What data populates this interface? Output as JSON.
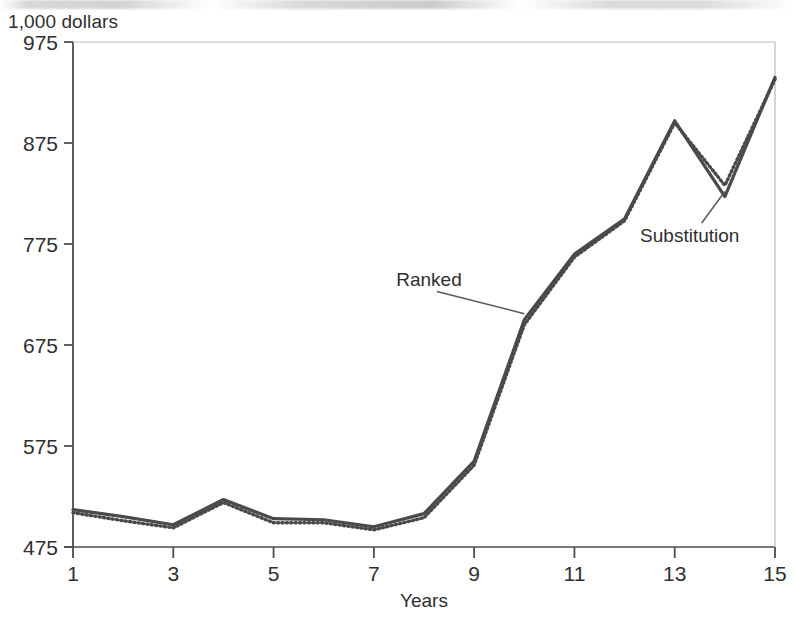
{
  "chart_data": {
    "type": "line",
    "title": "1,000 dollars",
    "subtitle": "",
    "xlabel": "Years",
    "ylabel": "1,000 dollars",
    "x": [
      1,
      2,
      3,
      4,
      5,
      6,
      7,
      8,
      9,
      10,
      11,
      12,
      13,
      14,
      15
    ],
    "xlim": [
      1,
      15
    ],
    "ylim": [
      475,
      975
    ],
    "xticks": [
      1,
      3,
      5,
      7,
      9,
      11,
      13,
      15
    ],
    "xtick_labels": [
      "1",
      "3",
      "5",
      "7",
      "9",
      "11",
      "13",
      "15"
    ],
    "yticks": [
      475,
      575,
      675,
      775,
      875,
      975
    ],
    "ytick_labels": [
      "475",
      "575",
      "675",
      "775",
      "875",
      "975"
    ],
    "grid": false,
    "legend_position": "inline-annotations",
    "series": [
      {
        "name": "Ranked",
        "style": "solid",
        "color": "#4a4a4a",
        "values": [
          512,
          505,
          497,
          522,
          503,
          502,
          495,
          508,
          560,
          700,
          765,
          800,
          897,
          822,
          940
        ]
      },
      {
        "name": "Substitution",
        "style": "dotted",
        "color": "#4a4a4a",
        "values": [
          509,
          501,
          494,
          519,
          499,
          499,
          492,
          504,
          556,
          695,
          762,
          798,
          895,
          833,
          938
        ]
      }
    ],
    "annotations": [
      {
        "text": "Ranked",
        "target_x": 10.0,
        "target_y": 706,
        "label_x": 8.1,
        "label_y": 733
      },
      {
        "text": "Substitution",
        "target_x": 14.0,
        "target_y": 827,
        "label_x": 13.3,
        "label_y": 777
      }
    ]
  },
  "axes": {
    "x_title": "Years"
  }
}
